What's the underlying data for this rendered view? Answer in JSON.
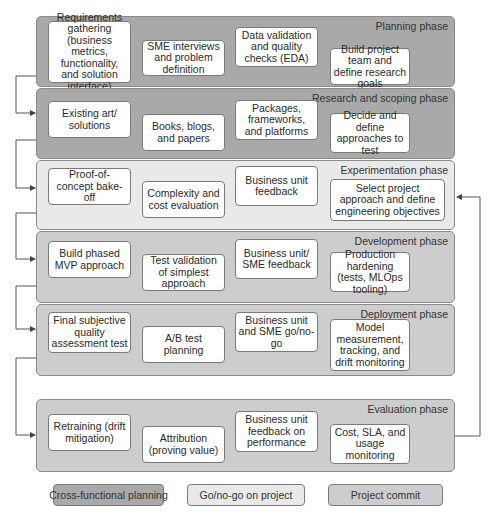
{
  "colors": {
    "cross_functional": "#a9a9a9",
    "go_no_go": "#e9e9e9",
    "project_commit": "#cdcdcd",
    "task_box": "#ffffff",
    "border": "#7a7a7a"
  },
  "phases": [
    {
      "title": "Planning phase",
      "category": "Cross-functional planning",
      "tasks": [
        "Requirements gathering (business metrics, functionality, and solution interface)",
        "SME interviews and problem definition",
        "Data validation and quality checks (EDA)",
        "Build project team and define research goals"
      ]
    },
    {
      "title": "Research and scoping phase",
      "category": "Cross-functional planning",
      "tasks": [
        "Existing art/ solutions",
        "Books, blogs, and papers",
        "Packages, frameworks, and platforms",
        "Decide and define approaches to test"
      ]
    },
    {
      "title": "Experimentation phase",
      "category": "Go/no-go on project",
      "tasks": [
        "Proof-of-concept bake-off",
        "Complexity and cost evaluation",
        "Business unit feedback",
        "Select project approach and define engineering objectives"
      ]
    },
    {
      "title": "Development phase",
      "category": "Project commit",
      "tasks": [
        "Build phased MVP approach",
        "Test validation of simplest approach",
        "Business unit/ SME feedback",
        "Production hardening (tests, MLOps tooling)"
      ]
    },
    {
      "title": "Deployment phase",
      "category": "Project commit",
      "tasks": [
        "Final subjective quality assessment test",
        "A/B test planning",
        "Business unit and SME go/no-go",
        "Model measurement, tracking, and drift monitoring"
      ]
    },
    {
      "title": "Evaluation phase",
      "category": "Project commit",
      "tasks": [
        "Retraining (drift mitigation)",
        "Attribution (proving value)",
        "Business unit feedback on performance",
        "Cost, SLA, and usage monitoring"
      ]
    }
  ],
  "legend": [
    {
      "label": "Cross-functional planning"
    },
    {
      "label": "Go/no-go on project"
    },
    {
      "label": "Project commit"
    }
  ],
  "connectors": {
    "sequential": "Each phase flows into the next via left-side arrows",
    "feedback_loop": "Evaluation phase loops back to Experimentation phase via right-side arrow"
  }
}
